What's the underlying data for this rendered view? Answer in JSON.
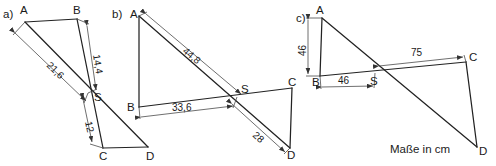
{
  "figure": {
    "note": "Maße in cm",
    "unit_text": "Maße in cm"
  },
  "cases": [
    {
      "id": "a",
      "label": "a)",
      "points": {
        "A": "A",
        "B": "B",
        "C": "C",
        "D": "D",
        "S": "S"
      },
      "dimensions": [
        {
          "name": "AS",
          "value": "21,6"
        },
        {
          "name": "BS",
          "value": "14,4"
        },
        {
          "name": "SC",
          "value": "12"
        }
      ]
    },
    {
      "id": "b",
      "label": "b)",
      "points": {
        "A": "A",
        "B": "B",
        "C": "C",
        "D": "D",
        "S": "S"
      },
      "dimensions": [
        {
          "name": "AS",
          "value": "44,8"
        },
        {
          "name": "BS",
          "value": "33,6"
        },
        {
          "name": "SD",
          "value": "28"
        }
      ]
    },
    {
      "id": "c",
      "label": "c)",
      "points": {
        "A": "A",
        "B": "B",
        "C": "C",
        "D": "D",
        "S": "S"
      },
      "dimensions": [
        {
          "name": "AB",
          "value": "46"
        },
        {
          "name": "BS",
          "value": "46"
        },
        {
          "name": "SC",
          "value": "75"
        }
      ]
    }
  ]
}
